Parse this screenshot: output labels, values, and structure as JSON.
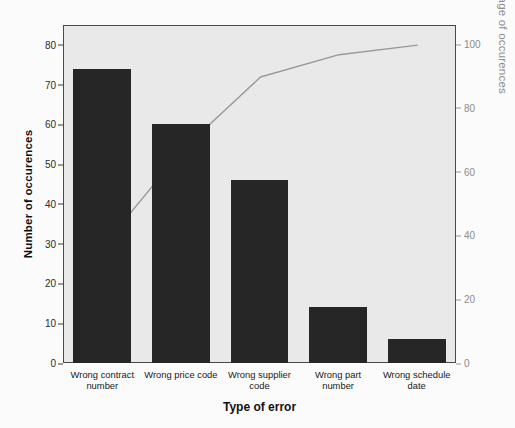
{
  "chart_data": {
    "type": "bar",
    "title": "",
    "xlabel": "Type of error",
    "ylabel": "Number of occurences",
    "y2label": "Cumulative percentage of occurences",
    "categories": [
      "Wrong contract\nnumber",
      "Wrong price code",
      "Wrong supplier\ncode",
      "Wrong part\nnumber",
      "Wrong schedule\ndate"
    ],
    "values": [
      74,
      60,
      46,
      14,
      6
    ],
    "cumulative_percent": [
      37,
      67,
      90,
      97,
      100
    ],
    "ylim": [
      0,
      85
    ],
    "y2lim": [
      0,
      106
    ],
    "yticks": [
      0,
      10,
      20,
      30,
      40,
      50,
      60,
      70,
      80
    ],
    "y2ticks": [
      0,
      20,
      40,
      60,
      80,
      100
    ],
    "grid": false,
    "legend": "none",
    "series": [
      {
        "name": "Number of occurences",
        "type": "bar",
        "values": [
          74,
          60,
          46,
          14,
          6
        ]
      },
      {
        "name": "Cumulative percentage of occurences",
        "type": "line",
        "values": [
          37,
          67,
          90,
          97,
          100
        ]
      }
    ],
    "colors": {
      "bar": "#262626",
      "line": "#999999",
      "plot_background": "#e9e9e9",
      "frame": "#4a4a4a",
      "left_axis_text": "#1a1a1a",
      "right_axis_text": "#8d8d8d"
    }
  }
}
